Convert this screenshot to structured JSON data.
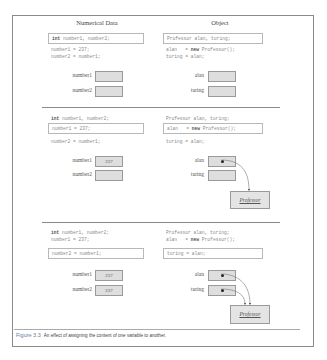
{
  "headers": {
    "left": "Numerical Data",
    "right": "Object"
  },
  "sections": [
    {
      "left_code": [
        "int number1, number2;",
        "number1 = 237;",
        "number2 = number1;"
      ],
      "right_code": [
        "Professor alan, turing;",
        "alan   = new Professor();",
        "turing = alan;"
      ],
      "highlighted_line": 0,
      "vars": {
        "number1": "",
        "number2": "",
        "alan": "",
        "turing": ""
      }
    },
    {
      "left_code": [
        "int number1, number2;",
        "number1 = 237;",
        "number2 = number1;"
      ],
      "right_code": [
        "Professor alan, turing;",
        "alan   = new Professor();",
        "turing = alan;"
      ],
      "highlighted_line": 1,
      "vars": {
        "number1": "237",
        "number2": "",
        "alan": "•",
        "turing": ""
      },
      "object_label": "Professor"
    },
    {
      "left_code": [
        "int number1, number2;",
        "number1 = 237;",
        "number2 = number1;"
      ],
      "right_code": [
        "Professor alan, turing;",
        "alan   = new Professor();",
        "turing = alan;"
      ],
      "highlighted_line": 2,
      "vars": {
        "number1": "237",
        "number2": "237",
        "alan": "•",
        "turing": "•"
      },
      "object_label": "Professor"
    }
  ],
  "labels": {
    "number1": "number1",
    "number2": "number2",
    "alan": "alan",
    "turing": "turing"
  },
  "caption": {
    "figure": "Figure 3.3",
    "text": "An effect of assigning the content of one variable to another."
  }
}
